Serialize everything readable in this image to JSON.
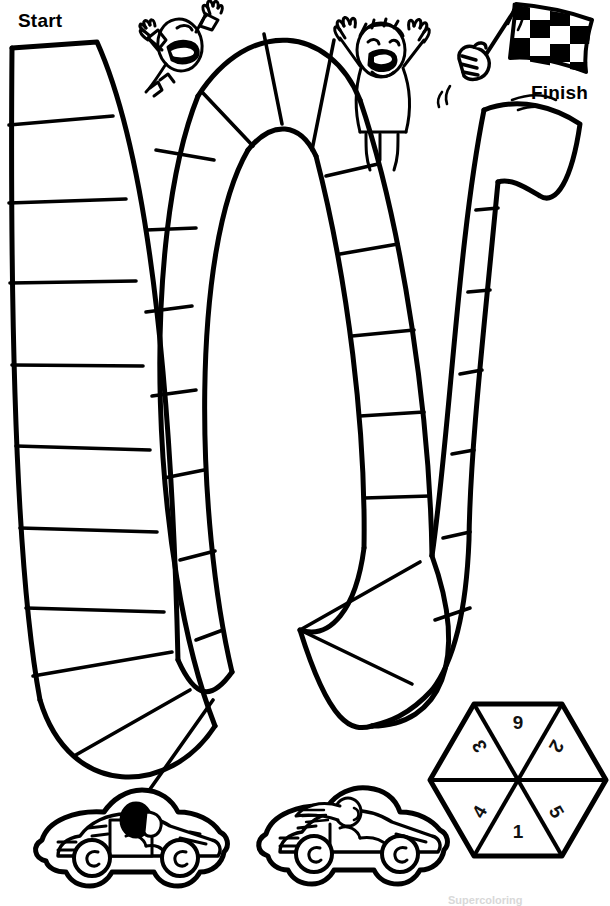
{
  "page": {
    "width": 610,
    "height": 906,
    "background_color": "#ffffff",
    "ink_color": "#000000",
    "style": "black and white line art / coloring book"
  },
  "labels": {
    "start": "Start",
    "finish": "Finish"
  },
  "footer": {
    "watermark": "Supercoloring"
  },
  "track": {
    "description": "Serpentine race track with three vertical lanes joined by U-turns",
    "lane_count": 3,
    "space_count": 24,
    "turns": [
      {
        "name": "top-turn",
        "position": "between lane 1 and lane 2",
        "direction": "up"
      },
      {
        "name": "bottom-turn",
        "position": "between lane 2 and lane 3",
        "direction": "down"
      }
    ]
  },
  "spinner": {
    "name": "hexagon-spinner",
    "shape": "hexagon",
    "wedge_count": 6,
    "numbers": [
      {
        "value": "6",
        "slot": "top",
        "rotation": 180
      },
      {
        "value": "2",
        "slot": "upper-right",
        "rotation": 120
      },
      {
        "value": "5",
        "slot": "lower-right",
        "rotation": 60
      },
      {
        "value": "1",
        "slot": "bottom",
        "rotation": 0
      },
      {
        "value": "4",
        "slot": "lower-left",
        "rotation": -60
      },
      {
        "value": "3",
        "slot": "upper-left",
        "rotation": -120
      }
    ]
  },
  "tokens": [
    {
      "name": "race-car-helmet-driver",
      "label": "Race car with helmeted driver"
    },
    {
      "name": "race-car-longhair-driver",
      "label": "Race car with long-haired driver"
    }
  ],
  "spectators": [
    {
      "name": "cheering-face-left",
      "label": "Cheering face with raised arms"
    },
    {
      "name": "cheering-person-right",
      "label": "Cheering person with raised arms"
    }
  ],
  "flag": {
    "name": "checkered-flag",
    "label": "Checkered finish flag held by a fist",
    "squares_dark": "#000000",
    "squares_light": "#ffffff"
  }
}
